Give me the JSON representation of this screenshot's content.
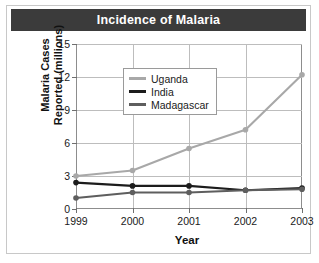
{
  "chart_data": {
    "type": "line",
    "title": "Incidence of Malaria",
    "xlabel": "Year",
    "ylabel": "Malaria Cases Reported (millions)",
    "ylabel_line1": "Malaria Cases",
    "ylabel_line2": "Reported (millions)",
    "categories": [
      "1999",
      "2000",
      "2001",
      "2002",
      "2003"
    ],
    "x": [
      1999,
      2000,
      2001,
      2002,
      2003
    ],
    "xlim": [
      1999,
      2003
    ],
    "ylim": [
      0,
      15
    ],
    "yticks": [
      "0",
      "3",
      "6",
      "9",
      "12",
      "15"
    ],
    "ytick_values": [
      0,
      3,
      6,
      9,
      12,
      15
    ],
    "grid": true,
    "legend_position": "upper-left-inside",
    "series": [
      {
        "name": "Uganda",
        "color": "#a8a8a8",
        "values": [
          3.0,
          3.5,
          5.5,
          7.2,
          12.2
        ]
      },
      {
        "name": "India",
        "color": "#1c1c1c",
        "values": [
          2.4,
          2.1,
          2.1,
          1.7,
          1.9
        ]
      },
      {
        "name": "Madagascar",
        "color": "#5e5e5e",
        "values": [
          1.0,
          1.5,
          1.5,
          1.7,
          1.8
        ]
      }
    ]
  },
  "figure": {
    "title_banner_color": "#3b3b3b",
    "title_text_color": "#ffffff",
    "background": "#ffffff",
    "border_color": "#c8c8c8"
  }
}
